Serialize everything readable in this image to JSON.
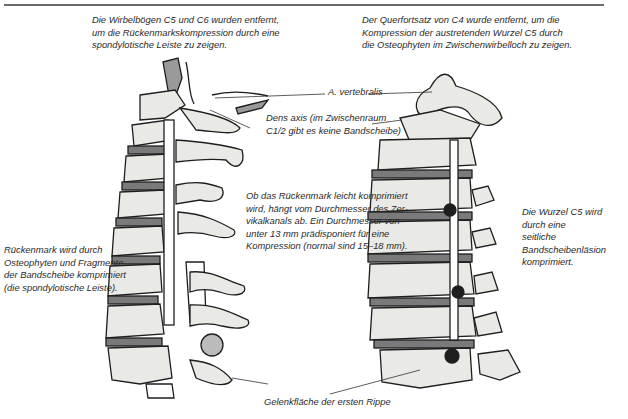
{
  "figure": {
    "left_illustration": {
      "name": "Seitenansicht Halswirbelsäule (Wirbelbögen C5/C6 entfernt)",
      "top_caption": "Die Wirbelbögen C5 und C6 wurden entfernt,\num die Rückenmarkskompression durch eine\nspondylotische Leiste zu zeigen.",
      "side_caption": "Rückenmark wird durch\nOsteophyten und Fragmente\nder Bandscheibe komprimiert\n(die spondylotische Leiste)."
    },
    "right_illustration": {
      "name": "Schrägansicht Halswirbelsäule (Querfortsatz C4 entfernt)",
      "top_caption": "Der Querfortsatz von C4 wurde entfernt, um die\nKompression der austretenden Wurzel C5 durch\ndie Osteophyten im Zwischenwirbelloch zu zeigen.",
      "side_caption": "Die Wurzel C5 wird durch eine\nseitliche Bandscheibenläsion\nkomprimiert."
    },
    "center_labels": {
      "a_vertebralis": "A. vertebralis",
      "dens_axis": "Dens axis (im Zwischenraum\nC1/2 gibt es keine Bandscheibe)",
      "canal_note": "Ob das Rückenmark leicht komprimiert\nwird, hängt vom Durchmesser des Zer-\nvikalkanals ab. Ein Durchmesser von\nunter 13 mm prädisponiert für eine\nKompression (normal sind 15–18 mm).",
      "first_rib": "Gelenkfläche der ersten Rippe"
    },
    "colors": {
      "ink": "#1e1e1e",
      "bone": "#e9e9e6",
      "shade": "#8a8a8a",
      "rule": "#6a6a6a"
    }
  }
}
